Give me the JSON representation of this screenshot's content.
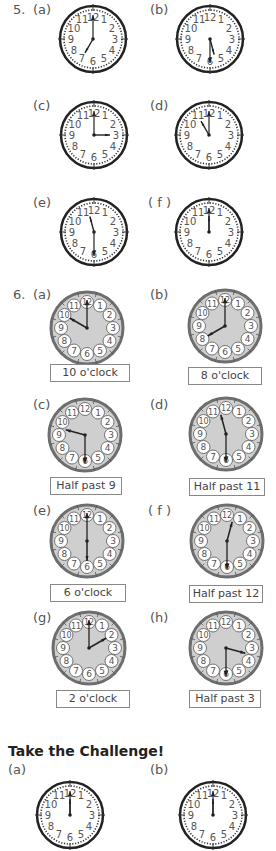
{
  "q5": {
    "number": "5.",
    "items": [
      {
        "label": "(a)",
        "hour": 7,
        "minute": 0,
        "lx": 33,
        "ly": 2,
        "cx": 93,
        "cy": 39
      },
      {
        "label": "(b)",
        "hour": 5,
        "minute": 30,
        "lx": 150,
        "ly": 2,
        "cx": 210,
        "cy": 39
      },
      {
        "label": "(c)",
        "hour": 3,
        "minute": 0,
        "lx": 33,
        "ly": 98,
        "cx": 94,
        "cy": 135
      },
      {
        "label": "(d)",
        "hour": 11,
        "minute": 0,
        "lx": 150,
        "ly": 98,
        "cx": 209,
        "cy": 135
      },
      {
        "label": "(e)",
        "hour": 11,
        "minute": 30,
        "lx": 33,
        "ly": 195,
        "cx": 94,
        "cy": 232
      },
      {
        "label": "( f )",
        "hour": 12,
        "minute": 0,
        "lx": 148,
        "ly": 195,
        "cx": 209,
        "cy": 232
      }
    ]
  },
  "q6": {
    "number": "6.",
    "items": [
      {
        "label": "(a)",
        "hour": 10,
        "minute": 0,
        "answer": "10 o'clock",
        "lx": 33,
        "ly": 287,
        "cx": 87,
        "cy": 328,
        "bx": 50,
        "by": 364,
        "bw": 78
      },
      {
        "label": "(b)",
        "hour": 8,
        "minute": 0,
        "answer": "8 o'clock",
        "lx": 150,
        "ly": 287,
        "cx": 225,
        "cy": 326,
        "bx": 188,
        "by": 367,
        "bw": 72
      },
      {
        "label": "(c)",
        "hour": 9,
        "minute": 30,
        "answer": "Half past 9",
        "lx": 33,
        "ly": 397,
        "cx": 85,
        "cy": 435,
        "bx": 50,
        "by": 477,
        "bw": 70
      },
      {
        "label": "(d)",
        "hour": 11,
        "minute": 30,
        "answer": "Half past 11",
        "lx": 150,
        "ly": 397,
        "cx": 226,
        "cy": 434,
        "bx": 189,
        "by": 478,
        "bw": 74
      },
      {
        "label": "(e)",
        "hour": 6,
        "minute": 0,
        "answer": "6 o'clock",
        "lx": 33,
        "ly": 503,
        "cx": 87,
        "cy": 541,
        "bx": 50,
        "by": 584,
        "bw": 74
      },
      {
        "label": "( f )",
        "hour": 12,
        "minute": 30,
        "answer": "Half past 12",
        "lx": 148,
        "ly": 503,
        "cx": 227,
        "cy": 541,
        "bx": 189,
        "by": 585,
        "bw": 72
      },
      {
        "label": "(g)",
        "hour": 2,
        "minute": 0,
        "answer": "2 o'clock",
        "lx": 33,
        "ly": 610,
        "cx": 89,
        "cy": 648,
        "bx": 56,
        "by": 690,
        "bw": 72
      },
      {
        "label": "(h)",
        "hour": 3,
        "minute": 30,
        "answer": "Half past 3",
        "lx": 150,
        "ly": 610,
        "cx": 226,
        "cy": 648,
        "bx": 189,
        "by": 690,
        "bw": 70
      }
    ]
  },
  "challenge": {
    "title": "Take the Challenge!",
    "items": [
      {
        "label": "(a)",
        "hour": 12,
        "minute": 0,
        "lx": 8,
        "ly": 762,
        "cx": 70,
        "cy": 815
      },
      {
        "label": "(b)",
        "hour": 12,
        "minute": 0,
        "lx": 150,
        "ly": 762,
        "cx": 213,
        "cy": 815
      }
    ]
  },
  "colors": {
    "ink": "#222222",
    "gray_face": "#cfcfcf",
    "gray_rim": "#6e6e6e",
    "text": "#555555"
  }
}
